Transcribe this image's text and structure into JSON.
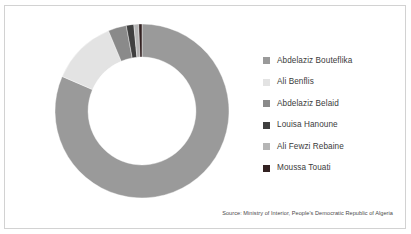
{
  "chart_data": {
    "type": "pie",
    "variant": "donut",
    "title": "",
    "subtitle": "",
    "xlabel": "",
    "ylabel": "",
    "legend_position": "right",
    "grid": false,
    "start_angle_deg": 0,
    "direction": "clockwise",
    "inner_radius_ratio": 0.62,
    "categories": [
      "Abdelaziz Bouteflika",
      "Ali Benflis",
      "Abdelaziz Belaid",
      "Louisa Hanoune",
      "Ali Fewzi Rebaine",
      "Moussa Touati"
    ],
    "values": [
      81.5,
      12.2,
      3.4,
      1.4,
      0.9,
      0.6
    ],
    "colors": [
      "#9a9a9a",
      "#e3e3e3",
      "#8a8a8a",
      "#3f3f3f",
      "#b5b5b5",
      "#332222"
    ],
    "series": [
      {
        "name": "Share of vote",
        "values": [
          81.5,
          12.2,
          3.4,
          1.4,
          0.9,
          0.6
        ]
      }
    ],
    "slices": [
      {
        "label": "Abdelaziz Bouteflika",
        "value": 81.5,
        "color": "#9a9a9a"
      },
      {
        "label": "Ali Benflis",
        "value": 12.2,
        "color": "#e3e3e3"
      },
      {
        "label": "Abdelaziz Belaid",
        "value": 3.4,
        "color": "#8a8a8a"
      },
      {
        "label": "Louisa Hanoune",
        "value": 1.4,
        "color": "#3f3f3f"
      },
      {
        "label": "Ali Fewzi Rebaine",
        "value": 0.9,
        "color": "#b5b5b5"
      },
      {
        "label": "Moussa Touati",
        "value": 0.6,
        "color": "#332222"
      }
    ],
    "source": "Source: Ministry of Interior, People's Democratic Republic of Algeria"
  },
  "legend": {
    "items": [
      {
        "label": "Abdelaziz Bouteflika",
        "color": "#9a9a9a"
      },
      {
        "label": "Ali Benflis",
        "color": "#e3e3e3"
      },
      {
        "label": "Abdelaziz Belaid",
        "color": "#8a8a8a"
      },
      {
        "label": "Louisa Hanoune",
        "color": "#3f3f3f"
      },
      {
        "label": "Ali Fewzi Rebaine",
        "color": "#b5b5b5"
      },
      {
        "label": "Moussa Touati",
        "color": "#332222"
      }
    ]
  },
  "footer": {
    "source": "Source: Ministry of Interior, People's Democratic Republic of Algeria"
  },
  "style": {
    "background": "#ffffff",
    "border_color": "#d2d2d2",
    "text_color": "#3b3b3b",
    "source_text_color": "#4a4a4a"
  }
}
